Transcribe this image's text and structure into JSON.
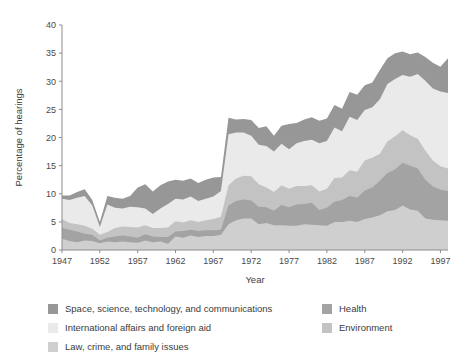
{
  "chart_data": {
    "type": "area",
    "stacked": true,
    "title": "",
    "xlabel": "Year",
    "ylabel": "Percentage of hearings",
    "xlim": [
      1947,
      1998
    ],
    "ylim": [
      0,
      40
    ],
    "ytick_step": 5,
    "xtick_step": 5,
    "grid": false,
    "legend_position": "bottom",
    "yticks": [
      0,
      5,
      10,
      15,
      20,
      25,
      30,
      35,
      40
    ],
    "xticks": [
      1947,
      1952,
      1957,
      1962,
      1967,
      1972,
      1977,
      1982,
      1987,
      1992,
      1997
    ],
    "x": [
      1947,
      1948,
      1949,
      1950,
      1951,
      1952,
      1953,
      1954,
      1955,
      1956,
      1957,
      1958,
      1959,
      1960,
      1961,
      1962,
      1963,
      1964,
      1965,
      1966,
      1967,
      1968,
      1969,
      1970,
      1971,
      1972,
      1973,
      1974,
      1975,
      1976,
      1977,
      1978,
      1979,
      1980,
      1981,
      1982,
      1983,
      1984,
      1985,
      1986,
      1987,
      1988,
      1989,
      1990,
      1991,
      1992,
      1993,
      1994,
      1995,
      1996,
      1997,
      1998
    ],
    "series": [
      {
        "name": "Law, crime, and family issues",
        "color": "#cfcfcf",
        "values": [
          2.0,
          1.6,
          1.4,
          1.7,
          1.6,
          1.2,
          1.5,
          1.4,
          1.5,
          1.4,
          1.3,
          1.7,
          1.4,
          1.5,
          1.1,
          2.4,
          2.2,
          2.6,
          2.3,
          2.5,
          2.5,
          2.7,
          4.6,
          5.3,
          5.6,
          5.6,
          4.6,
          4.8,
          4.4,
          4.4,
          4.3,
          4.3,
          4.6,
          4.5,
          4.4,
          4.3,
          5.0,
          5.0,
          5.2,
          5.0,
          5.5,
          5.8,
          6.2,
          6.9,
          7.1,
          7.9,
          7.2,
          7.0,
          5.6,
          5.4,
          5.3,
          5.2
        ]
      },
      {
        "name": "Health",
        "color": "#a3a3a3",
        "values": [
          1.9,
          2.0,
          1.9,
          1.2,
          1.1,
          0.5,
          0.7,
          1.0,
          1.1,
          1.0,
          0.9,
          1.1,
          1.0,
          0.8,
          1.2,
          0.9,
          1.2,
          1.0,
          1.1,
          1.0,
          1.0,
          0.9,
          3.3,
          3.4,
          3.4,
          3.2,
          3.1,
          2.8,
          2.6,
          3.6,
          3.3,
          3.8,
          3.6,
          3.9,
          2.7,
          3.2,
          3.6,
          3.9,
          4.4,
          4.3,
          5.1,
          5.3,
          6.1,
          6.8,
          7.2,
          7.6,
          7.8,
          7.5,
          6.9,
          5.9,
          5.4,
          5.3
        ]
      },
      {
        "name": "Environment",
        "color": "#c3c3c3",
        "values": [
          1.6,
          1.2,
          1.3,
          1.4,
          1.1,
          1.0,
          1.0,
          1.5,
          1.6,
          1.7,
          1.8,
          1.6,
          1.5,
          1.6,
          1.7,
          1.8,
          1.5,
          1.7,
          1.6,
          1.8,
          2.0,
          2.3,
          3.6,
          4.0,
          4.2,
          4.3,
          4.0,
          3.5,
          3.3,
          3.5,
          3.3,
          3.3,
          3.2,
          3.1,
          3.3,
          3.4,
          4.2,
          4.0,
          4.6,
          4.6,
          5.3,
          5.3,
          4.8,
          5.6,
          5.9,
          5.8,
          5.4,
          5.3,
          5.2,
          4.6,
          4.2,
          4.0
        ]
      },
      {
        "name": "International affairs and foreign aid",
        "color": "#eaeaea",
        "values": [
          3.6,
          4.1,
          4.7,
          5.3,
          4.1,
          1.4,
          4.9,
          3.6,
          3.2,
          3.6,
          3.6,
          3.0,
          2.5,
          3.5,
          4.2,
          4.0,
          4.1,
          4.2,
          3.7,
          3.8,
          4.0,
          4.6,
          9.1,
          8.2,
          7.7,
          7.2,
          7.0,
          7.4,
          7.2,
          7.4,
          7.0,
          7.6,
          8.0,
          8.1,
          8.6,
          8.5,
          9.0,
          8.2,
          9.5,
          9.2,
          9.0,
          9.0,
          9.7,
          10.2,
          10.2,
          9.8,
          10.4,
          11.5,
          12.4,
          12.8,
          13.3,
          13.4
        ]
      },
      {
        "name": "Space, science, technology, and communications",
        "color": "#979797",
        "values": [
          0.6,
          0.8,
          1.0,
          1.2,
          1.0,
          0.9,
          1.5,
          1.8,
          1.7,
          1.9,
          3.5,
          4.3,
          4.0,
          4.1,
          4.0,
          3.4,
          3.3,
          3.2,
          3.2,
          3.4,
          3.4,
          2.5,
          2.9,
          2.3,
          2.4,
          2.8,
          3.0,
          3.5,
          2.8,
          3.2,
          4.5,
          3.6,
          3.8,
          4.0,
          4.0,
          4.0,
          4.0,
          4.0,
          4.4,
          4.5,
          4.4,
          4.4,
          5.2,
          4.6,
          4.6,
          4.2,
          4.0,
          3.8,
          4.2,
          4.6,
          4.4,
          6.2
        ]
      }
    ],
    "legend": [
      {
        "label": "Space, science, technology, and communications",
        "color": "#979797",
        "column": 1
      },
      {
        "label": "International affairs and foreign aid",
        "color": "#eaeaea",
        "column": 1
      },
      {
        "label": "Law, crime, and family issues",
        "color": "#cfcfcf",
        "column": 1
      },
      {
        "label": "Health",
        "color": "#a3a3a3",
        "column": 2
      },
      {
        "label": "Environment",
        "color": "#c3c3c3",
        "column": 2
      }
    ]
  }
}
